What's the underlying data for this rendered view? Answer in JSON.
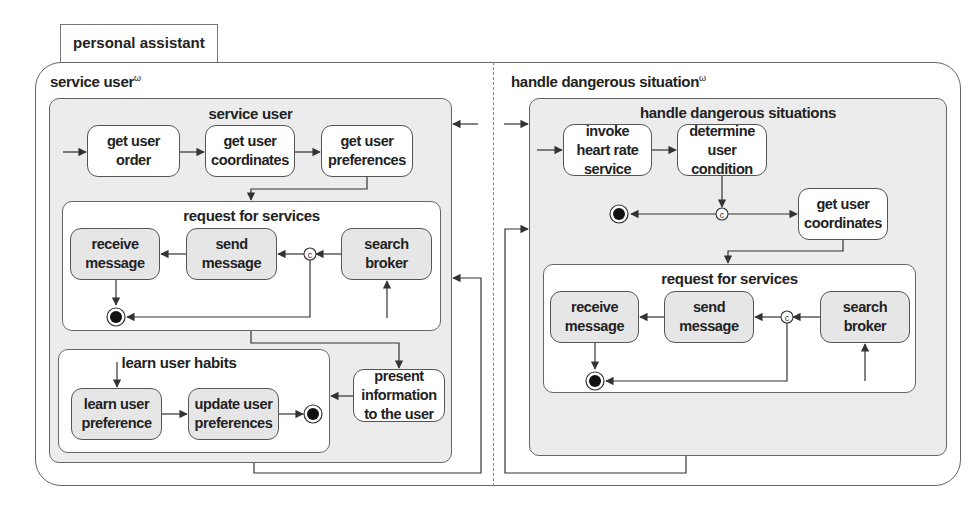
{
  "diagram": {
    "tab_label": "personal assistant",
    "regions": [
      {
        "label": "service user",
        "superscript": "ω",
        "container": {
          "title": "service user",
          "states": [
            "get user order",
            "get user coordinates",
            "get user preferences",
            "present information to the user"
          ],
          "subcontainers": [
            {
              "title": "request for services",
              "states": [
                "receive message",
                "send message",
                "search broker"
              ],
              "choice": "c"
            },
            {
              "title": "learn user habits",
              "states": [
                "learn user preference",
                "update user preferences"
              ]
            }
          ]
        }
      },
      {
        "label": "handle dangerous situation",
        "superscript": "ω",
        "container": {
          "title": "handle dangerous situations",
          "states": [
            "invoke heart rate service",
            "determine user condition",
            "get user coordinates"
          ],
          "choice": "c",
          "subcontainers": [
            {
              "title": "request for services",
              "states": [
                "receive message",
                "send message",
                "search broker"
              ],
              "choice": "c"
            }
          ]
        }
      }
    ]
  },
  "labels": {
    "l_order_1": "get user",
    "l_order_2": "order",
    "l_coord_1": "get user",
    "l_coord_2": "coordinates",
    "l_pref_1": "get user",
    "l_pref_2": "preferences",
    "l_recv_1": "receive",
    "l_recv_2": "message",
    "l_send_1": "send",
    "l_send_2": "message",
    "l_search_1": "search",
    "l_search_2": "broker",
    "l_learn_1": "learn user",
    "l_learn_2": "preference",
    "l_update_1": "update user",
    "l_update_2": "preferences",
    "l_present_1": "present",
    "l_present_2": "information",
    "l_present_3": "to the user",
    "l_invoke_1": "invoke",
    "l_invoke_2": "heart rate",
    "l_invoke_3": "service",
    "l_determine_1": "determine",
    "l_determine_2": "user",
    "l_determine_3": "condition",
    "choice_symbol": "c"
  },
  "colors": {
    "line": "#333333",
    "container_fill": "#ececec",
    "state_grey": "#e6e6e6",
    "state_white": "#ffffff"
  }
}
